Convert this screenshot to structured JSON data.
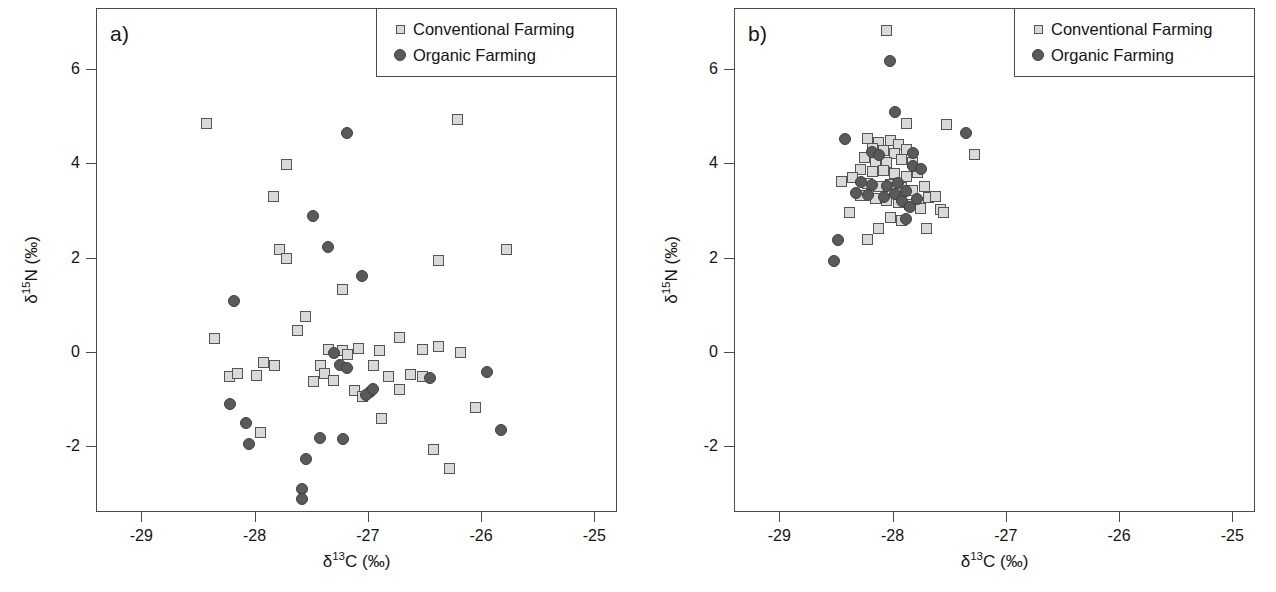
{
  "figure": {
    "axis_title_x_html": "&delta;<sup>13</sup>C (&permil;)",
    "axis_title_y_html": "&delta;<sup>15</sup>N (&permil;)"
  },
  "legend": {
    "conventional_label": "Conventional Farming",
    "organic_label": "Organic Farming",
    "conventional_icon": "open-square-marker",
    "organic_icon": "filled-circle-marker",
    "conventional_color": "#d9d9d9",
    "conventional_border_color": "#555555",
    "organic_color": "#5a5a5a"
  },
  "axes": {
    "x_ticks": [
      "-29",
      "-28",
      "-27",
      "-26",
      "-25"
    ],
    "x_tick_values": [
      -29,
      -28,
      -27,
      -26,
      -25
    ],
    "y_ticks": [
      "6",
      "4",
      "2",
      "0",
      "-2"
    ],
    "y_tick_values": [
      6,
      4,
      2,
      0,
      -2
    ],
    "xlim": [
      -29.4,
      -24.8
    ],
    "ylim": [
      -3.4,
      7.3
    ]
  },
  "panels": [
    {
      "label": "a)"
    },
    {
      "label": "b)"
    }
  ],
  "chart_data": [
    {
      "type": "scatter",
      "title": "a)",
      "xlabel": "δ13C (‰)",
      "ylabel": "δ15N (‰)",
      "xlim": [
        -29.4,
        -24.8
      ],
      "ylim": [
        -3.4,
        7.3
      ],
      "grid": false,
      "legend_position": "top-right",
      "series": [
        {
          "name": "Conventional Farming",
          "marker": "open-square",
          "points": [
            [
              -28.42,
              4.85
            ],
            [
              -27.72,
              3.97
            ],
            [
              -27.83,
              3.3
            ],
            [
              -27.78,
              2.18
            ],
            [
              -27.72,
              1.98
            ],
            [
              -26.21,
              4.93
            ],
            [
              -25.78,
              2.17
            ],
            [
              -26.38,
              1.95
            ],
            [
              -27.22,
              1.32
            ],
            [
              -27.55,
              0.75
            ],
            [
              -27.62,
              0.45
            ],
            [
              -28.35,
              0.28
            ],
            [
              -27.92,
              -0.22
            ],
            [
              -27.82,
              -0.28
            ],
            [
              -27.35,
              0.05
            ],
            [
              -27.22,
              0.02
            ],
            [
              -27.18,
              -0.05
            ],
            [
              -27.08,
              0.08
            ],
            [
              -26.9,
              0.02
            ],
            [
              -26.72,
              0.3
            ],
            [
              -26.52,
              0.05
            ],
            [
              -26.38,
              0.12
            ],
            [
              -26.18,
              -0.02
            ],
            [
              -26.62,
              -0.48
            ],
            [
              -27.42,
              -0.3
            ],
            [
              -27.38,
              -0.45
            ],
            [
              -27.3,
              -0.6
            ],
            [
              -27.48,
              -0.62
            ],
            [
              -26.95,
              -0.28
            ],
            [
              -26.82,
              -0.52
            ],
            [
              -26.72,
              -0.8
            ],
            [
              -27.12,
              -0.82
            ],
            [
              -27.05,
              -0.95
            ],
            [
              -28.22,
              -0.52
            ],
            [
              -28.15,
              -0.45
            ],
            [
              -27.95,
              -1.72
            ],
            [
              -26.88,
              -1.42
            ],
            [
              -26.05,
              -1.18
            ],
            [
              -26.52,
              -0.52
            ],
            [
              -26.42,
              -2.08
            ],
            [
              -26.28,
              -2.48
            ],
            [
              -27.98,
              -0.5
            ]
          ]
        },
        {
          "name": "Organic Farming",
          "marker": "filled-circle",
          "points": [
            [
              -27.18,
              4.65
            ],
            [
              -27.48,
              2.88
            ],
            [
              -27.35,
              2.22
            ],
            [
              -27.05,
              1.62
            ],
            [
              -28.18,
              1.08
            ],
            [
              -27.3,
              -0.02
            ],
            [
              -27.25,
              -0.28
            ],
            [
              -27.18,
              -0.35
            ],
            [
              -26.98,
              -0.85
            ],
            [
              -27.02,
              -0.92
            ],
            [
              -26.45,
              -0.55
            ],
            [
              -25.95,
              -0.42
            ],
            [
              -25.82,
              -1.65
            ],
            [
              -28.22,
              -1.1
            ],
            [
              -28.08,
              -1.52
            ],
            [
              -28.05,
              -1.95
            ],
            [
              -27.42,
              -1.82
            ],
            [
              -27.22,
              -1.85
            ],
            [
              -27.55,
              -2.28
            ],
            [
              -27.58,
              -2.92
            ],
            [
              -27.58,
              -3.12
            ],
            [
              -26.95,
              -0.78
            ]
          ]
        }
      ]
    },
    {
      "type": "scatter",
      "title": "b)",
      "xlabel": "δ13C (‰)",
      "ylabel": "δ15N (‰)",
      "xlim": [
        -29.4,
        -24.8
      ],
      "ylim": [
        -3.4,
        7.3
      ],
      "grid": false,
      "legend_position": "top-right",
      "series": [
        {
          "name": "Conventional Farming",
          "marker": "open-square",
          "points": [
            [
              -28.05,
              6.82
            ],
            [
              -27.88,
              4.85
            ],
            [
              -27.52,
              4.82
            ],
            [
              -27.28,
              4.18
            ],
            [
              -28.22,
              4.52
            ],
            [
              -28.12,
              4.45
            ],
            [
              -28.02,
              4.48
            ],
            [
              -27.95,
              4.4
            ],
            [
              -28.18,
              4.32
            ],
            [
              -28.08,
              4.28
            ],
            [
              -27.98,
              4.22
            ],
            [
              -27.88,
              4.3
            ],
            [
              -28.25,
              4.12
            ],
            [
              -28.15,
              4.05
            ],
            [
              -28.05,
              4.02
            ],
            [
              -27.92,
              4.08
            ],
            [
              -27.82,
              4.02
            ],
            [
              -28.28,
              3.88
            ],
            [
              -28.18,
              3.82
            ],
            [
              -28.08,
              3.85
            ],
            [
              -27.98,
              3.78
            ],
            [
              -27.88,
              3.72
            ],
            [
              -27.78,
              3.8
            ],
            [
              -28.35,
              3.7
            ],
            [
              -28.45,
              3.62
            ],
            [
              -28.22,
              3.58
            ],
            [
              -28.12,
              3.52
            ],
            [
              -28.02,
              3.55
            ],
            [
              -27.92,
              3.48
            ],
            [
              -27.82,
              3.42
            ],
            [
              -27.72,
              3.52
            ],
            [
              -27.68,
              3.28
            ],
            [
              -28.28,
              3.32
            ],
            [
              -28.15,
              3.25
            ],
            [
              -28.05,
              3.22
            ],
            [
              -27.95,
              3.18
            ],
            [
              -27.85,
              3.12
            ],
            [
              -27.75,
              3.05
            ],
            [
              -27.62,
              3.3
            ],
            [
              -27.58,
              3.02
            ],
            [
              -28.02,
              2.85
            ],
            [
              -27.92,
              2.78
            ],
            [
              -28.12,
              2.62
            ],
            [
              -28.22,
              2.38
            ],
            [
              -27.7,
              2.62
            ],
            [
              -27.55,
              2.95
            ],
            [
              -28.38,
              2.95
            ]
          ]
        },
        {
          "name": "Organic Farming",
          "marker": "filled-circle",
          "points": [
            [
              -28.02,
              6.18
            ],
            [
              -27.98,
              5.1
            ],
            [
              -28.42,
              4.52
            ],
            [
              -28.18,
              4.25
            ],
            [
              -28.12,
              4.18
            ],
            [
              -27.82,
              4.22
            ],
            [
              -27.35,
              4.65
            ],
            [
              -27.82,
              3.95
            ],
            [
              -27.75,
              3.88
            ],
            [
              -28.28,
              3.6
            ],
            [
              -28.18,
              3.55
            ],
            [
              -28.05,
              3.52
            ],
            [
              -27.95,
              3.58
            ],
            [
              -28.32,
              3.38
            ],
            [
              -28.22,
              3.32
            ],
            [
              -28.08,
              3.28
            ],
            [
              -27.98,
              3.35
            ],
            [
              -27.88,
              3.42
            ],
            [
              -27.92,
              3.2
            ],
            [
              -27.85,
              3.08
            ],
            [
              -27.78,
              3.25
            ],
            [
              -27.88,
              2.82
            ],
            [
              -28.48,
              2.38
            ],
            [
              -28.52,
              1.92
            ]
          ]
        }
      ]
    }
  ]
}
